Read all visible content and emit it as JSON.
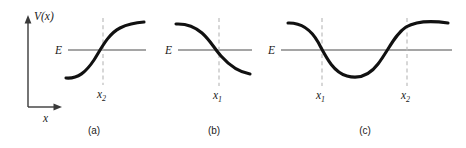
{
  "figure": {
    "title": "",
    "background_color": "#ffffff",
    "curve_color": "#111111",
    "energy_line_color": "#878787",
    "dashed_line_color": "#bdbdbd",
    "axis_color": "#3a3a3a",
    "axes": {
      "y_label": "V(x)",
      "x_label": "x"
    },
    "panels": [
      {
        "caption": "(a)",
        "energy_label": "E",
        "curve_shape": "increasing-sigmoid",
        "turning_points": [
          {
            "label_base": "x",
            "label_sub": "2",
            "label_full": "x₂"
          }
        ]
      },
      {
        "caption": "(b)",
        "energy_label": "E",
        "curve_shape": "decreasing-sigmoid",
        "turning_points": [
          {
            "label_base": "x",
            "label_sub": "1",
            "label_full": "x₁"
          }
        ]
      },
      {
        "caption": "(c)",
        "energy_label": "E",
        "curve_shape": "potential-well",
        "turning_points": [
          {
            "label_base": "x",
            "label_sub": "1",
            "label_full": "x₁"
          },
          {
            "label_base": "x",
            "label_sub": "2",
            "label_full": "x₂"
          }
        ]
      }
    ]
  }
}
